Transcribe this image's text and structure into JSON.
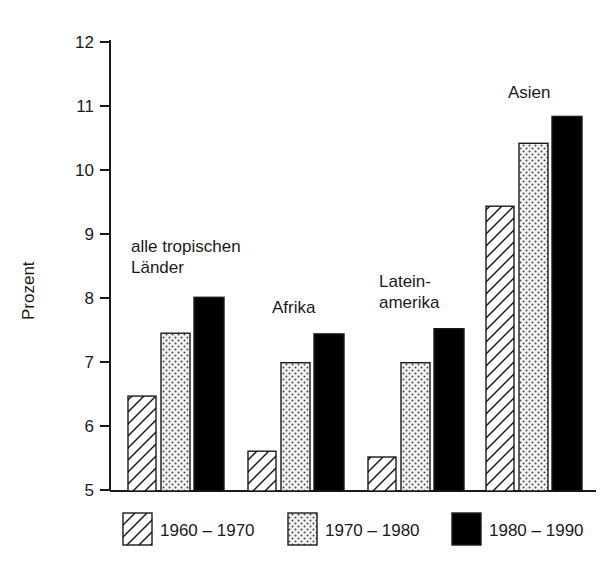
{
  "chart_data": {
    "type": "bar",
    "title": "",
    "xlabel": "",
    "ylabel": "Prozent",
    "ylim": [
      5,
      12
    ],
    "yticks": [
      5,
      6,
      7,
      8,
      9,
      10,
      11,
      12
    ],
    "ytick_labels": [
      "5",
      "6",
      "7",
      "8",
      "9",
      "10",
      "11",
      "12"
    ],
    "grid": false,
    "legend_position": "bottom",
    "categories": [
      "alle tropischen Länder",
      "Afrika",
      "Lateinamerika",
      "Asien"
    ],
    "category_label_lines": [
      [
        "alle tropischen",
        "Länder"
      ],
      [
        "Afrika"
      ],
      [
        "Latein-",
        "amerika"
      ],
      [
        "Asien"
      ]
    ],
    "series": [
      {
        "name": "1960 – 1970",
        "pattern": "diagonal-hatch",
        "values": [
          6.48,
          5.62,
          5.53,
          9.44
        ]
      },
      {
        "name": "1970 – 1980",
        "pattern": "dotted",
        "values": [
          7.46,
          7.0,
          7.0,
          10.42
        ]
      },
      {
        "name": "1980 – 1990",
        "pattern": "solid-black",
        "values": [
          8.02,
          7.45,
          7.53,
          10.84
        ]
      }
    ]
  },
  "axis": {
    "y_title": "Prozent",
    "ticks": [
      {
        "value": "12"
      },
      {
        "value": "11"
      },
      {
        "value": "10"
      },
      {
        "value": "9"
      },
      {
        "value": "8"
      },
      {
        "value": "7"
      },
      {
        "value": "6"
      },
      {
        "value": "5"
      }
    ]
  },
  "group_labels": [
    {
      "line1": "alle tropischen",
      "line2": "Länder"
    },
    {
      "line1": "Afrika",
      "line2": ""
    },
    {
      "line1": "Latein-",
      "line2": "amerika"
    },
    {
      "line1": "Asien",
      "line2": ""
    }
  ],
  "legend": {
    "items": [
      {
        "label": "1960 – 1970",
        "pattern": "diagonal-hatch"
      },
      {
        "label": "1970 – 1980",
        "pattern": "dotted"
      },
      {
        "label": "1980 – 1990",
        "pattern": "solid-black"
      }
    ]
  },
  "colors": {
    "ink": "#1a1a1a",
    "background": "#ffffff",
    "black_bar": "#000000",
    "dot_fill": "#f2f2f2"
  }
}
